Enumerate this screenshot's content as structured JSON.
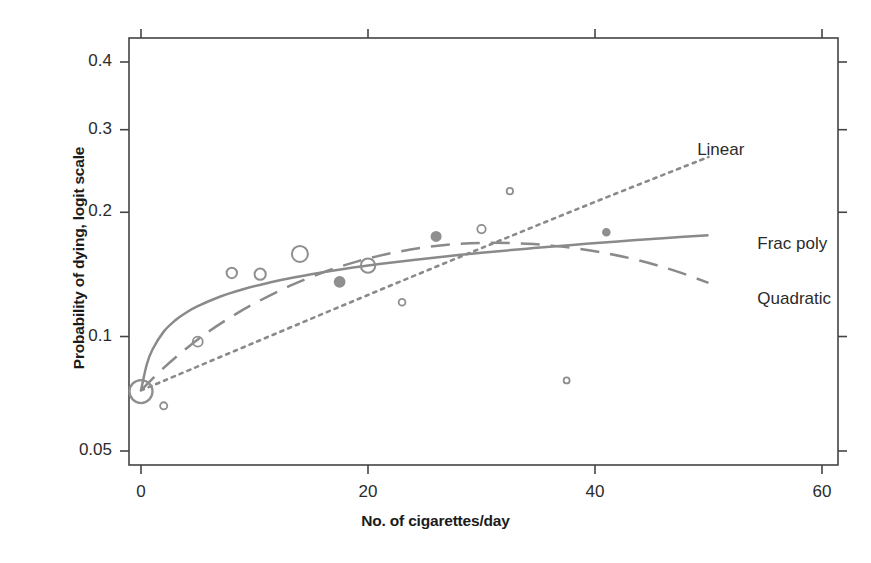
{
  "chart_data": {
    "type": "scatter",
    "title": "",
    "subtitle": "",
    "xlabel": "No. of cigarettes/day",
    "ylabel": "Probability of dying, logit scale",
    "xlim": [
      -0.8,
      61.3
    ],
    "ylim": [
      0.0455,
      0.455
    ],
    "yscale": "logit",
    "grid": false,
    "legend_position": "inline-right-of-curves",
    "xticks": [
      0,
      20,
      40,
      60
    ],
    "xtick_labels": [
      "0",
      "20",
      "40",
      "60"
    ],
    "yticks": [
      0.05,
      0.1,
      0.2,
      0.3,
      0.4
    ],
    "ytick_labels": [
      "0.05",
      "0.1",
      "0.2",
      "0.3",
      "0.4"
    ],
    "points": {
      "name": "Observed group proportions (marker area ~ group size)",
      "marker": "circle",
      "x": [
        0,
        2,
        5,
        8,
        10.5,
        14,
        17.5,
        20,
        23,
        26,
        30,
        32.5,
        37.5,
        41
      ],
      "y": [
        0.072,
        0.066,
        0.097,
        0.144,
        0.143,
        0.16,
        0.137,
        0.15,
        0.122,
        0.176,
        0.183,
        0.223,
        0.077,
        0.18
      ],
      "sizes": [
        11.5,
        3.6,
        5.0,
        5.2,
        5.6,
        8.0,
        5.0,
        7.2,
        3.4,
        4.6,
        4.2,
        3.2,
        3.0,
        3.4
      ],
      "filled": [
        false,
        false,
        false,
        false,
        false,
        false,
        true,
        false,
        false,
        true,
        false,
        false,
        false,
        true
      ]
    },
    "series": [
      {
        "name": "Frac poly",
        "style": "solid",
        "label_x": 54.3,
        "label_y": 0.168,
        "x": [
          0,
          0.5,
          1,
          2,
          3,
          4,
          5,
          7,
          9,
          11,
          13,
          15,
          18,
          21,
          24,
          27,
          30,
          34,
          38,
          42,
          46,
          50
        ],
        "y": [
          0.0725,
          0.0846,
          0.0925,
          0.1029,
          0.1098,
          0.115,
          0.1193,
          0.1261,
          0.1314,
          0.1358,
          0.1396,
          0.143,
          0.1474,
          0.1513,
          0.1548,
          0.158,
          0.161,
          0.1647,
          0.1681,
          0.1713,
          0.1743,
          0.1771
        ]
      },
      {
        "name": "Quadratic",
        "style": "long-dash",
        "label_x": 54.3,
        "label_y": 0.1235,
        "x": [
          0,
          2,
          4,
          6,
          8,
          10,
          13,
          16,
          19,
          22,
          25,
          28,
          31,
          34,
          36,
          38,
          41,
          44,
          47,
          50
        ],
        "y": [
          0.0725,
          0.083,
          0.0932,
          0.1031,
          0.1124,
          0.1212,
          0.1335,
          0.1443,
          0.1534,
          0.1606,
          0.1658,
          0.169,
          0.1701,
          0.1691,
          0.1676,
          0.1654,
          0.1606,
          0.1541,
          0.1459,
          0.1362
        ]
      },
      {
        "name": "Linear",
        "style": "fine-dot",
        "label_x": 49.0,
        "label_y": 0.272,
        "x": [
          0,
          10,
          20,
          30,
          40,
          50
        ],
        "y": [
          0.0725,
          0.0965,
          0.1272,
          0.1652,
          0.211,
          0.264
        ]
      }
    ]
  },
  "colors": {
    "curve": "#8a8a8a",
    "point": "#8f8f8f",
    "axis": "#444444",
    "text": "#231f20",
    "background": "#ffffff"
  }
}
